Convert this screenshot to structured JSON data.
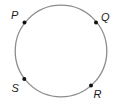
{
  "diagram": {
    "width": 119,
    "height": 107,
    "circle": {
      "cx": 61,
      "cy": 51,
      "r": 45.8,
      "stroke": "#8c8c8c"
    },
    "points": [
      {
        "name": "P",
        "x": 24.5,
        "y": 22.5,
        "label": "P",
        "label_x": 11,
        "label_y": 19
      },
      {
        "name": "Q",
        "x": 96,
        "y": 22.5,
        "label": "Q",
        "label_x": 101,
        "label_y": 21
      },
      {
        "name": "R",
        "x": 91,
        "y": 85.5,
        "label": "R",
        "label_x": 93.5,
        "label_y": 97.5
      },
      {
        "name": "S",
        "x": 24.3,
        "y": 79,
        "label": "S",
        "label_x": 11.5,
        "label_y": 92
      }
    ]
  }
}
